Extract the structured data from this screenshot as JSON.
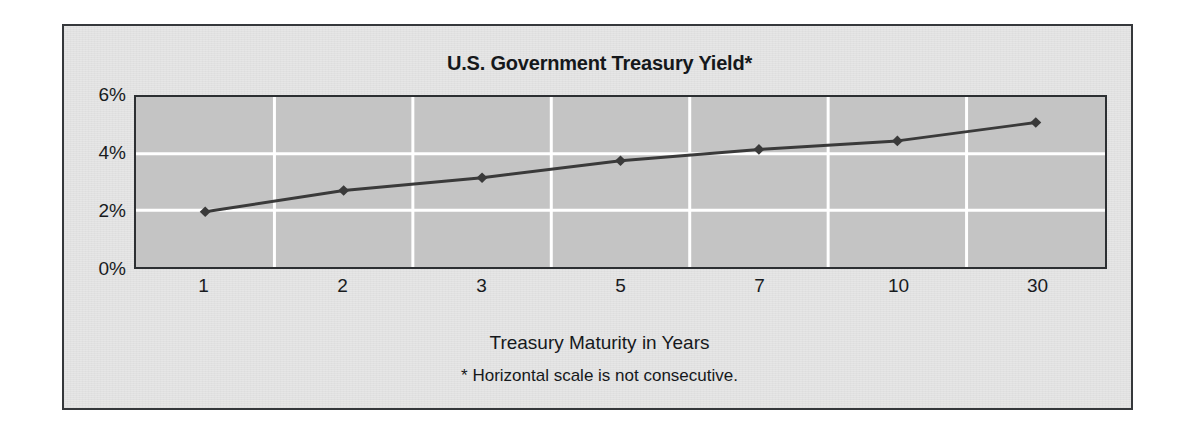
{
  "figure": {
    "title": "U.S. Government Treasury Yield*",
    "x_axis_title": "Treasury Maturity in Years",
    "footnote": "* Horizontal scale is not consecutive.",
    "panel_background": "#e6e6e6",
    "plot_background": "#c4c4c4",
    "border_color": "#2c2f32",
    "gridline_color": "#ffffff",
    "series_color": "#3a3a3a"
  },
  "chart_data": {
    "type": "line",
    "title": "U.S. Government Treasury Yield*",
    "xlabel": "Treasury Maturity in Years",
    "ylabel": "",
    "categories": [
      "1",
      "2",
      "3",
      "5",
      "7",
      "10",
      "30"
    ],
    "values": [
      1.95,
      2.7,
      3.15,
      3.75,
      4.15,
      4.45,
      5.1
    ],
    "ylim": [
      0,
      6
    ],
    "y_ticks": [
      0,
      2,
      4,
      6
    ],
    "y_tick_labels": [
      "0%",
      "2%",
      "4%",
      "6%"
    ],
    "x_tick_labels": [
      "1",
      "2",
      "3",
      "5",
      "7",
      "10",
      "30"
    ],
    "grid": true,
    "grid_orientation": "both",
    "legend": false,
    "marker": "diamond",
    "annotations": [
      "* Horizontal scale is not consecutive."
    ],
    "series": [
      {
        "name": "U.S. Government Treasury Yield",
        "values": [
          1.95,
          2.7,
          3.15,
          3.75,
          4.15,
          4.45,
          5.1
        ]
      }
    ]
  }
}
